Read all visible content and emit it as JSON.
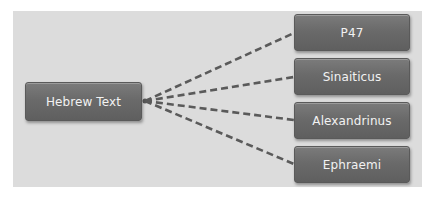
{
  "diagram": {
    "type": "one-to-many connection diagram",
    "source": {
      "label": "Hebrew Text"
    },
    "targets": [
      {
        "label": "P47"
      },
      {
        "label": "Sinaiticus"
      },
      {
        "label": "Alexandrinus"
      },
      {
        "label": "Ephraemi"
      }
    ],
    "connector_style": "dashed",
    "colors": {
      "background_panel": "#dcdcdc",
      "node_fill": "#6a6a6a",
      "node_text": "#f2f2f2",
      "connector": "#5a5a5a"
    }
  }
}
